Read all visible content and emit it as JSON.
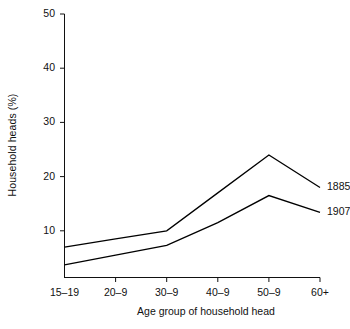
{
  "chart_data": {
    "type": "line",
    "title": "",
    "xlabel": "Age group of household head",
    "ylabel": "Household heads (%)",
    "categories": [
      "15–19",
      "20–9",
      "30–9",
      "40–9",
      "50–9",
      "60+"
    ],
    "ylim": [
      0,
      50
    ],
    "yticks": [
      10,
      20,
      30,
      40,
      50
    ],
    "ytick_labels": [
      "10",
      "20",
      "30",
      "40",
      "50"
    ],
    "grid": false,
    "legend_position": "right-inline-end-of-line",
    "series": [
      {
        "name": "1885",
        "label": "1885",
        "color": "#000000",
        "values": [
          7.0,
          8.5,
          10.0,
          17.0,
          24.0,
          18.0
        ]
      },
      {
        "name": "1907",
        "label": "1907",
        "color": "#000000",
        "values": [
          3.7,
          5.5,
          7.3,
          11.5,
          16.5,
          13.4
        ]
      }
    ]
  },
  "axes": {
    "y_axis_name": "y-axis",
    "x_axis_name": "x-axis"
  }
}
